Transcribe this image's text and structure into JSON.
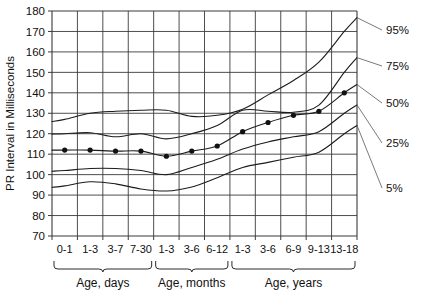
{
  "chart_data": {
    "type": "line",
    "title": "",
    "xlabel": "",
    "ylabel": "PR Interval in Milliseconds",
    "ylim": [
      70,
      180
    ],
    "ytick_step": 10,
    "yticks": [
      "70",
      "80",
      "90",
      "100",
      "110",
      "120",
      "130",
      "140",
      "150",
      "160",
      "170",
      "180"
    ],
    "grid": true,
    "legend_position": "right",
    "categories": [
      "0-1",
      "1-3",
      "3-7",
      "7-30",
      "1-3",
      "3-6",
      "6-12",
      "1-3",
      "3-6",
      "6-9",
      "9-13",
      "13-18"
    ],
    "group_labels": [
      {
        "label": "Age, days",
        "from": 0,
        "to": 3
      },
      {
        "label": "Age, months",
        "from": 4,
        "to": 6
      },
      {
        "label": "Age, years",
        "from": 7,
        "to": 11
      }
    ],
    "series": [
      {
        "name": "95%",
        "label": "95%",
        "markers": false,
        "values": [
          127,
          130,
          131,
          131.5,
          131.5,
          128.5,
          129,
          132,
          139,
          146,
          155,
          170
        ]
      },
      {
        "name": "75%",
        "label": "75%",
        "markers": false,
        "values": [
          120,
          120.5,
          118.5,
          120,
          117.5,
          120,
          124,
          131.5,
          131,
          130.5,
          134,
          150
        ]
      },
      {
        "name": "50%",
        "label": "50%",
        "markers": true,
        "values": [
          112,
          112,
          111.5,
          111.5,
          109,
          111.5,
          114,
          121,
          125.5,
          129,
          131,
          140
        ]
      },
      {
        "name": "25%",
        "label": "25%",
        "markers": false,
        "values": [
          102,
          103,
          103,
          102,
          100,
          103.5,
          107.5,
          112.5,
          116,
          118.5,
          121,
          130
        ]
      },
      {
        "name": "5%",
        "label": "5%",
        "markers": false,
        "values": [
          94.5,
          96.5,
          95.5,
          93,
          92,
          94,
          98.5,
          103.5,
          106,
          108.5,
          111,
          120
        ]
      }
    ],
    "legend_entries": [
      "95%",
      "75%",
      "50%",
      "25%",
      "5%"
    ]
  }
}
